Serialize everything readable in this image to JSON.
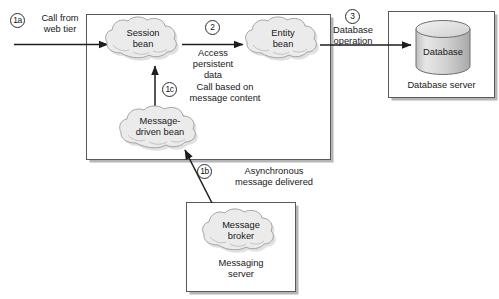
{
  "diagram": {
    "colors": {
      "box_border": "#555a60",
      "box_shadow": "#78787d",
      "cloud_fill": "#e9e9e9",
      "cloud_stroke": "#9a9a9a",
      "cylinder_fill": "#d9d9d9",
      "text": "#17181a",
      "arrow": "#1c1d1f"
    },
    "steps": [
      {
        "id": "1a",
        "label": "1a",
        "caption": "Call from\nweb tier"
      },
      {
        "id": "2",
        "label": "2",
        "caption": "Access\npersistent\ndata"
      },
      {
        "id": "3",
        "label": "3",
        "caption": "Database\noperation"
      },
      {
        "id": "1c",
        "label": "1c",
        "caption": "Call based on\nmessage content"
      },
      {
        "id": "1b",
        "label": "1b",
        "caption": "Asynchronous\nmessage delivered"
      }
    ],
    "containers": [
      {
        "id": "ejb_container",
        "caption": ""
      },
      {
        "id": "database_server",
        "caption": "Database server"
      },
      {
        "id": "messaging_server",
        "caption": "Messaging\nserver"
      }
    ],
    "clouds": [
      {
        "id": "session_bean",
        "label": "Session\nbean"
      },
      {
        "id": "entity_bean",
        "label": "Entity\nbean"
      },
      {
        "id": "message_driven_bean",
        "label": "Message-\ndriven bean"
      },
      {
        "id": "message_broker",
        "label": "Message\nbroker"
      }
    ],
    "cylinders": [
      {
        "id": "database",
        "label": "Database"
      }
    ]
  }
}
